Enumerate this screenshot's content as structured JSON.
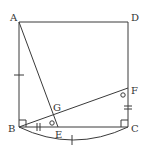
{
  "diagram": {
    "type": "geometry",
    "points": {
      "A": {
        "label": "A",
        "x": 19,
        "y": 22
      },
      "D": {
        "label": "D",
        "x": 128,
        "y": 22
      },
      "B": {
        "label": "B",
        "x": 19,
        "y": 127
      },
      "C": {
        "label": "C",
        "x": 128,
        "y": 127
      },
      "E": {
        "label": "E",
        "x": 58,
        "y": 127
      },
      "F": {
        "label": "F",
        "x": 128,
        "y": 88
      },
      "G": {
        "label": "G",
        "x": 53,
        "y": 116
      }
    },
    "segments": [
      "AB",
      "BC",
      "CD",
      "DA",
      "AE",
      "BF"
    ],
    "arc": {
      "from": "B",
      "to": "C",
      "mark": "single tick"
    },
    "marks": {
      "AB": "single tick",
      "BE": "double tick",
      "FC": "double tick",
      "angle_E": "circle",
      "angle_F": "circle",
      "right_angle_B": true,
      "right_angle_C": true
    },
    "colors": {
      "line": "#3a3a3a",
      "label": "#333333",
      "background": "#ffffff"
    }
  }
}
